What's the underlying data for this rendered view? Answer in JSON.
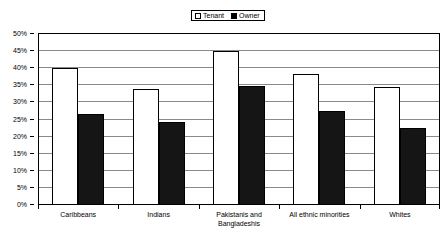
{
  "chart_data": {
    "type": "bar",
    "title": "",
    "xlabel": "",
    "ylabel": "",
    "ylim": [
      0,
      50
    ],
    "grid": true,
    "legend_position": "top-center",
    "categories": [
      "Caribbeans",
      "Indians",
      "Pakistanis and Bangladeshis",
      "All ethnic minorities",
      "Whites"
    ],
    "category_lines": [
      [
        "Caribbeans"
      ],
      [
        "Indians"
      ],
      [
        "Pakistanis and",
        "Bangladeshis"
      ],
      [
        "All ethnic minorities"
      ],
      [
        "Whites"
      ]
    ],
    "series": [
      {
        "name": "Tenant",
        "color": "#ffffff",
        "values": [
          40.0,
          33.8,
          45.0,
          38.4,
          34.5
        ]
      },
      {
        "name": "Owner",
        "color": "#151515",
        "values": [
          26.6,
          24.3,
          34.7,
          27.5,
          22.4
        ]
      }
    ],
    "y_ticks": [
      {
        "value": 50,
        "label": "50%"
      },
      {
        "value": 45,
        "label": "45%"
      },
      {
        "value": 40,
        "label": "40%"
      },
      {
        "value": 35,
        "label": "35%"
      },
      {
        "value": 30,
        "label": "30%"
      },
      {
        "value": 25,
        "label": "25%"
      },
      {
        "value": 20,
        "label": "20%"
      },
      {
        "value": 15,
        "label": "15%"
      },
      {
        "value": 10,
        "label": "10%"
      },
      {
        "value": 5,
        "label": "5%"
      },
      {
        "value": 0,
        "label": "0%"
      }
    ]
  },
  "legend": {
    "entries": [
      {
        "label": "Tenant",
        "swatch": "hollow-square-swatch"
      },
      {
        "label": "Owner",
        "swatch": "filled-square-swatch"
      }
    ]
  }
}
